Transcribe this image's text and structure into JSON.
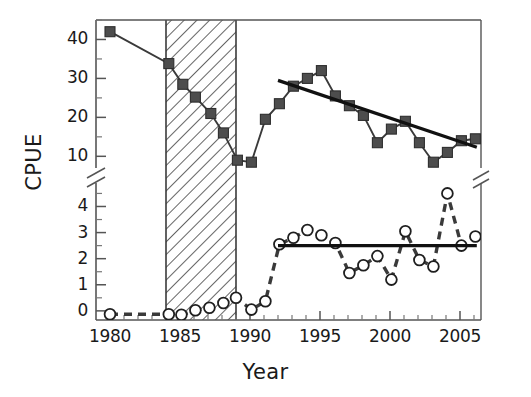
{
  "chart_data": {
    "type": "line",
    "title": "",
    "xlabel": "Year",
    "ylabel": "CPUE",
    "axis_break": true,
    "axis_note": "Y axis is broken between the lower panel (0-4.5) and the upper panel (10-45)",
    "xlim": [
      1979,
      2006.5
    ],
    "xticks": [
      1980,
      1985,
      1990,
      1995,
      2000,
      2005
    ],
    "xtick_labels": [
      "1980",
      "1985",
      "1990",
      "1995",
      "2000",
      "2005"
    ],
    "x_minor_ticks": [
      1981,
      1982,
      1983,
      1984,
      1986,
      1987,
      1988,
      1989,
      1991,
      1992,
      1993,
      1994,
      1996,
      1997,
      1998,
      1999,
      2001,
      2002,
      2003,
      2004,
      2006
    ],
    "upper_panel": {
      "ylim": [
        7,
        45
      ],
      "yticks": [
        10,
        20,
        30,
        40
      ],
      "ytick_labels": [
        "10",
        "20",
        "30",
        "40"
      ],
      "y_minor_ticks": [
        15,
        25,
        35,
        45
      ]
    },
    "lower_panel": {
      "ylim": [
        -0.35,
        4.9
      ],
      "yticks": [
        0,
        1,
        2,
        3,
        4
      ],
      "ytick_labels": [
        "0",
        "1",
        "2",
        "3",
        "4"
      ],
      "y_minor_ticks": [
        0.5,
        1.5,
        2.5,
        3.5,
        4.5
      ]
    },
    "grid": false,
    "legend": "none",
    "shaded_region": {
      "name": "hatched-period",
      "style": "diagonal-hatch",
      "x_start": 1984,
      "x_end": 1989
    },
    "series": [
      {
        "name": "filled-squares",
        "marker": "square",
        "marker_fill": "#4d4d4d",
        "line_style": "solid",
        "panel": "upper",
        "x": [
          1980,
          1984.2,
          1985.2,
          1986.1,
          1987.2,
          1988.1,
          1989.1,
          1990.1,
          1991.1,
          1992.1,
          1993.1,
          1994.1,
          1995.1,
          1996.1,
          1997.1,
          1998.1,
          1999.1,
          2000.1,
          2001.1,
          2002.1,
          2003.1,
          2004.1,
          2005.1,
          2006.1
        ],
        "y": [
          42.0,
          33.8,
          28.5,
          25.2,
          21.0,
          16.0,
          9.0,
          8.5,
          19.5,
          23.5,
          28.0,
          30.0,
          32.0,
          25.5,
          23.0,
          20.5,
          13.5,
          17.0,
          19.0,
          13.5,
          8.5,
          11.0,
          14.0,
          14.5
        ]
      },
      {
        "name": "open-circles",
        "marker": "circle",
        "marker_fill": "#ffffff",
        "line_style": "dashed",
        "panel": "lower",
        "x": [
          1980,
          1984.2,
          1985.1,
          1986.1,
          1987.1,
          1988.1,
          1989.0,
          1990.1,
          1991.1,
          1992.1,
          1993.1,
          1994.1,
          1995.1,
          1996.1,
          1997.1,
          1998.1,
          1999.1,
          2000.1,
          2001.1,
          2002.1,
          2003.1,
          2004.1,
          2005.1,
          2006.1
        ],
        "y": [
          -0.13,
          -0.13,
          -0.15,
          0.02,
          0.12,
          0.3,
          0.5,
          0.05,
          0.37,
          2.55,
          2.8,
          3.1,
          2.9,
          2.6,
          1.45,
          1.75,
          2.1,
          1.2,
          3.05,
          1.95,
          1.7,
          4.5,
          2.5,
          2.85
        ]
      }
    ],
    "trend_lines": [
      {
        "name": "upper-trend-line",
        "panel": "upper",
        "style": "solid-thick",
        "x_start": 1992.0,
        "y_start": 29.5,
        "x_end": 2006.2,
        "y_end": 12.3
      },
      {
        "name": "lower-mean-line",
        "panel": "lower",
        "style": "solid-thick",
        "x_start": 1992.0,
        "y_start": 2.5,
        "x_end": 2006.2,
        "y_end": 2.5
      }
    ]
  },
  "axes": {
    "ylabel": "CPUE",
    "xlabel": "Year",
    "xtick_labels": [
      "1980",
      "1985",
      "1990",
      "1995",
      "2000",
      "2005"
    ],
    "ytick_labels_upper": [
      "40",
      "30",
      "20",
      "10"
    ],
    "ytick_labels_lower": [
      "4",
      "3",
      "2",
      "1",
      "0"
    ]
  }
}
